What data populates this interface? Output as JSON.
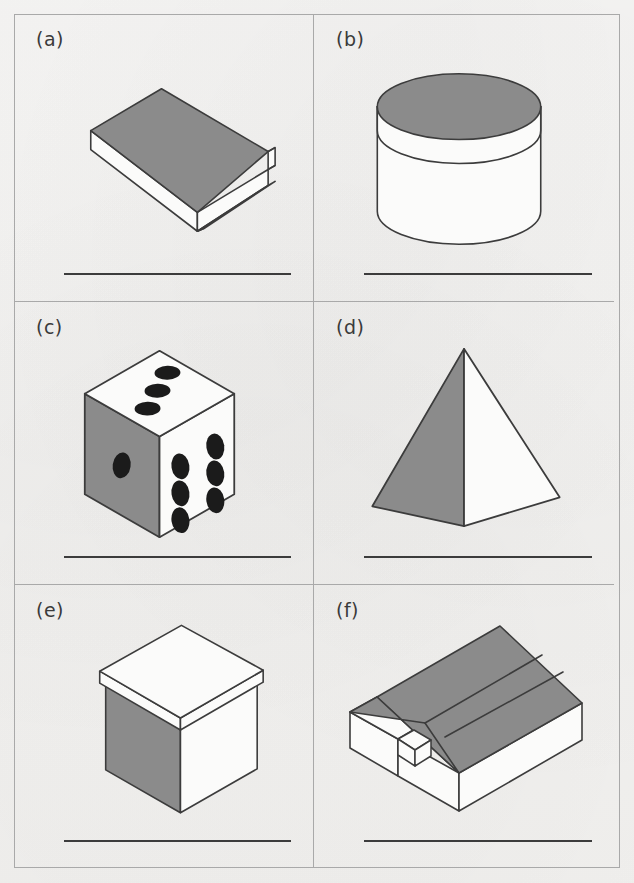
{
  "worksheet": {
    "title": "Identify the 3D shapes",
    "colors": {
      "paper": "#f3f2f0",
      "frame": "#a9a9a9",
      "shape_shade": "#8b8b8b",
      "shape_light": "#fbfbfa",
      "outline": "#3c3c3c",
      "answer_line": "#3c3c3c",
      "label_text": "#3a3a3a",
      "pip": "#1b1b1b"
    },
    "layout": {
      "columns": 2,
      "rows": 3,
      "width": 634,
      "height": 883
    },
    "panels": [
      {
        "id": "a",
        "label": "(a)",
        "shape": "book",
        "shape_name": "rectangular-prism-book",
        "shaded_face": "top",
        "answer_value": ""
      },
      {
        "id": "b",
        "label": "(b)",
        "shape": "cylinder",
        "shape_name": "cylinder-round-box",
        "shaded_face": "top-lid",
        "answer_value": ""
      },
      {
        "id": "c",
        "label": "(c)",
        "shape": "cube",
        "shape_name": "cube-die",
        "shaded_face": "left",
        "pips": {
          "top_face": 3,
          "left_face": 1,
          "right_face": 6
        },
        "answer_value": ""
      },
      {
        "id": "d",
        "label": "(d)",
        "shape": "pyramid",
        "shape_name": "square-pyramid",
        "shaded_face": "left",
        "answer_value": ""
      },
      {
        "id": "e",
        "label": "(e)",
        "shape": "cube-box-with-lid",
        "shape_name": "cube-box-with-lid",
        "shaded_face": "left",
        "answer_value": ""
      },
      {
        "id": "f",
        "label": "(f)",
        "shape": "cuboid-matchbox",
        "shape_name": "rectangular-prism-matchbox",
        "shaded_face": "top",
        "answer_value": ""
      }
    ]
  }
}
